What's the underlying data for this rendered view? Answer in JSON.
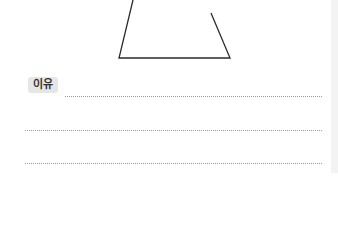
{
  "worksheet": {
    "figure": {
      "shape": "incomplete-trapezoid",
      "stroke_color": "#2a2a2a"
    },
    "reason_label": "이유",
    "answer_lines": 3
  }
}
